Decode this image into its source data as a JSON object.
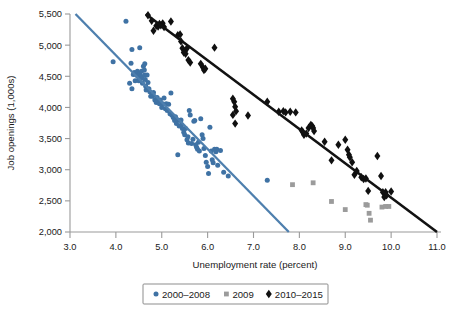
{
  "chart_data": {
    "type": "scatter",
    "title": "",
    "xlabel": "Unemployment rate (percent)",
    "ylabel": "Job openings (1,000s)",
    "xlim": [
      3.0,
      11.0
    ],
    "ylim": [
      2000,
      5500
    ],
    "xticks": [
      "3.0",
      "4.0",
      "5.0",
      "6.0",
      "7.0",
      "8.0",
      "9.0",
      "10.0",
      "11.0"
    ],
    "xtick_values": [
      3.0,
      4.0,
      5.0,
      6.0,
      7.0,
      8.0,
      9.0,
      10.0,
      11.0
    ],
    "yticks": [
      "2,000",
      "2,500",
      "3,000",
      "3,500",
      "4,000",
      "4,500",
      "5,000",
      "5,500"
    ],
    "ytick_values": [
      2000,
      2500,
      3000,
      3500,
      4000,
      4500,
      5000,
      5500
    ],
    "grid": false,
    "legend_position": "bottom-center",
    "colors": {
      "series_2000_2008": "#3f72a4",
      "series_2009": "#9b9b9b",
      "series_2010_2015": "#101010",
      "trendline_2000_2008": "#4e7fae",
      "trendline_2010_2015": "#121212",
      "axis": "#9a9a9a",
      "text": "#1a1a1a",
      "background": "#ffffff"
    },
    "series": [
      {
        "name": "2000-2008",
        "marker": "circle",
        "color": "#3f72a4",
        "points": [
          [
            3.94,
            4735
          ],
          [
            4.22,
            5385
          ],
          [
            4.33,
            4710
          ],
          [
            4.3,
            4390
          ],
          [
            4.35,
            4300
          ],
          [
            4.38,
            4530
          ],
          [
            4.4,
            4560
          ],
          [
            4.42,
            4430
          ],
          [
            4.45,
            4520
          ],
          [
            4.47,
            4580
          ],
          [
            4.48,
            4495
          ],
          [
            4.5,
            4430
          ],
          [
            4.52,
            4545
          ],
          [
            4.53,
            4480
          ],
          [
            4.55,
            4500
          ],
          [
            4.56,
            4580
          ],
          [
            4.57,
            4470
          ],
          [
            4.58,
            4390
          ],
          [
            4.6,
            4660
          ],
          [
            4.62,
            4600
          ],
          [
            4.63,
            4520
          ],
          [
            4.64,
            4450
          ],
          [
            4.65,
            4340
          ],
          [
            4.66,
            4280
          ],
          [
            4.68,
            4520
          ],
          [
            4.7,
            4400
          ],
          [
            4.72,
            4300
          ],
          [
            4.74,
            4250
          ],
          [
            4.76,
            4180
          ],
          [
            4.35,
            4930
          ],
          [
            4.52,
            4960
          ],
          [
            4.63,
            4700
          ],
          [
            4.8,
            4180
          ],
          [
            4.82,
            4240
          ],
          [
            4.85,
            4120
          ],
          [
            4.88,
            4080
          ],
          [
            4.9,
            4160
          ],
          [
            4.92,
            4100
          ],
          [
            4.95,
            4060
          ],
          [
            4.97,
            4120
          ],
          [
            5.0,
            4000
          ],
          [
            5.02,
            4060
          ],
          [
            5.05,
            4150
          ],
          [
            5.08,
            3980
          ],
          [
            5.1,
            4060
          ],
          [
            5.12,
            3950
          ],
          [
            5.15,
            4050
          ],
          [
            5.18,
            3900
          ],
          [
            5.2,
            4230
          ],
          [
            5.22,
            3880
          ],
          [
            5.25,
            3840
          ],
          [
            5.28,
            3790
          ],
          [
            5.3,
            3850
          ],
          [
            5.32,
            3740
          ],
          [
            5.35,
            3800
          ],
          [
            5.38,
            3700
          ],
          [
            5.4,
            3790
          ],
          [
            5.42,
            3800
          ],
          [
            5.43,
            3720
          ],
          [
            5.45,
            3660
          ],
          [
            5.35,
            3240
          ],
          [
            5.48,
            3600
          ],
          [
            5.5,
            3560
          ],
          [
            5.52,
            3660
          ],
          [
            5.55,
            3480
          ],
          [
            5.57,
            3530
          ],
          [
            5.58,
            3430
          ],
          [
            5.6,
            3950
          ],
          [
            5.62,
            3880
          ],
          [
            5.65,
            3420
          ],
          [
            5.68,
            3490
          ],
          [
            5.7,
            3780
          ],
          [
            5.72,
            3790
          ],
          [
            5.74,
            3400
          ],
          [
            5.76,
            3360
          ],
          [
            5.78,
            3330
          ],
          [
            5.8,
            3440
          ],
          [
            5.82,
            3300
          ],
          [
            5.85,
            3820
          ],
          [
            5.88,
            3560
          ],
          [
            5.9,
            3500
          ],
          [
            5.92,
            3340
          ],
          [
            5.95,
            3230
          ],
          [
            5.97,
            3120
          ],
          [
            6.0,
            3050
          ],
          [
            6.02,
            2940
          ],
          [
            6.05,
            3680
          ],
          [
            6.08,
            3300
          ],
          [
            6.1,
            3160
          ],
          [
            6.12,
            3110
          ],
          [
            6.15,
            3330
          ],
          [
            6.18,
            3290
          ],
          [
            6.2,
            3330
          ],
          [
            6.28,
            3310
          ],
          [
            6.35,
            2960
          ],
          [
            6.45,
            2900
          ],
          [
            7.3,
            2830
          ],
          [
            6.22,
            3070
          ]
        ],
        "trendline": {
          "x": [
            3.12,
            7.77
          ],
          "y": [
            5500,
            2000
          ]
        }
      },
      {
        "name": "2009",
        "marker": "square",
        "color": "#9b9b9b",
        "points": [
          [
            7.85,
            2760
          ],
          [
            8.3,
            2790
          ],
          [
            8.7,
            2490
          ],
          [
            9.0,
            2360
          ],
          [
            9.45,
            2440
          ],
          [
            9.48,
            2430
          ],
          [
            9.52,
            2300
          ],
          [
            9.55,
            2190
          ],
          [
            9.8,
            2400
          ],
          [
            9.88,
            2410
          ],
          [
            9.95,
            2410
          ]
        ],
        "trendline": null
      },
      {
        "name": "2010-2015",
        "marker": "diamond",
        "color": "#101010",
        "points": [
          [
            4.7,
            5480
          ],
          [
            4.78,
            5390
          ],
          [
            4.82,
            5230
          ],
          [
            4.88,
            5310
          ],
          [
            4.92,
            5300
          ],
          [
            4.95,
            5340
          ],
          [
            4.98,
            5320
          ],
          [
            5.02,
            5350
          ],
          [
            5.05,
            5290
          ],
          [
            5.2,
            5380
          ],
          [
            5.35,
            5160
          ],
          [
            5.4,
            5170
          ],
          [
            5.42,
            5060
          ],
          [
            5.45,
            4950
          ],
          [
            5.48,
            4880
          ],
          [
            5.5,
            4900
          ],
          [
            5.52,
            4860
          ],
          [
            5.55,
            4950
          ],
          [
            5.58,
            4760
          ],
          [
            5.62,
            4720
          ],
          [
            5.85,
            4700
          ],
          [
            5.9,
            4640
          ],
          [
            5.92,
            4600
          ],
          [
            5.95,
            4620
          ],
          [
            6.15,
            4960
          ],
          [
            6.55,
            4140
          ],
          [
            6.58,
            4090
          ],
          [
            6.6,
            4010
          ],
          [
            6.62,
            3940
          ],
          [
            6.55,
            3880
          ],
          [
            6.6,
            3740
          ],
          [
            6.88,
            3870
          ],
          [
            7.3,
            4090
          ],
          [
            7.55,
            3930
          ],
          [
            7.65,
            3940
          ],
          [
            7.7,
            3920
          ],
          [
            7.8,
            3930
          ],
          [
            7.92,
            3920
          ],
          [
            8.05,
            3630
          ],
          [
            8.08,
            3600
          ],
          [
            8.1,
            3560
          ],
          [
            8.15,
            3580
          ],
          [
            8.2,
            3670
          ],
          [
            8.25,
            3720
          ],
          [
            8.28,
            3700
          ],
          [
            8.3,
            3670
          ],
          [
            8.32,
            3620
          ],
          [
            8.55,
            3450
          ],
          [
            8.7,
            3150
          ],
          [
            8.85,
            3400
          ],
          [
            9.0,
            3480
          ],
          [
            9.05,
            3320
          ],
          [
            9.08,
            3240
          ],
          [
            9.1,
            3200
          ],
          [
            9.15,
            3120
          ],
          [
            9.2,
            2920
          ],
          [
            9.25,
            2980
          ],
          [
            9.35,
            2880
          ],
          [
            9.4,
            2850
          ],
          [
            9.45,
            2860
          ],
          [
            9.5,
            2660
          ],
          [
            9.7,
            3220
          ],
          [
            9.78,
            2900
          ],
          [
            9.82,
            2640
          ],
          [
            9.85,
            2560
          ],
          [
            9.88,
            2640
          ],
          [
            9.9,
            2590
          ],
          [
            10.0,
            2650
          ]
        ],
        "trendline": {
          "x": [
            4.65,
            11.0
          ],
          "y": [
            5500,
            2000
          ]
        }
      }
    ]
  },
  "legend": {
    "items": [
      {
        "label": "2000–2008",
        "marker": "circle",
        "color": "#3f72a4"
      },
      {
        "label": "2009",
        "marker": "square",
        "color": "#9b9b9b"
      },
      {
        "label": "2010–2015",
        "marker": "diamond",
        "color": "#101010"
      }
    ]
  }
}
